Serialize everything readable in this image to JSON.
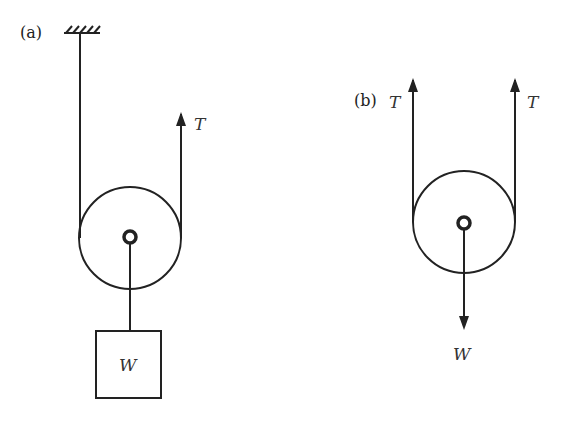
{
  "diagram": {
    "panel_a": {
      "label": "(a)",
      "tension_label": "T",
      "weight_label": "W"
    },
    "panel_b": {
      "label": "(b)",
      "tension_left_label": "T",
      "tension_right_label": "T",
      "weight_label": "W"
    },
    "colors": {
      "stroke": "#222222",
      "background": "#ffffff"
    }
  }
}
